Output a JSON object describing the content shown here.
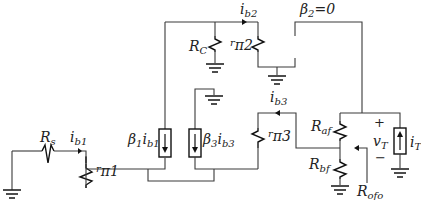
{
  "diagram": {
    "type": "small-signal equivalent circuit",
    "labels": {
      "Rs": {
        "main": "R",
        "sub": "s"
      },
      "ib1": {
        "main": "i",
        "sub": "b1"
      },
      "rpi1": {
        "main": "r",
        "sub": "π1"
      },
      "beta1_ib1": {
        "main": "β",
        "sub": "1",
        "main2": "i",
        "sub2": "b1"
      },
      "RC": {
        "main": "R",
        "sub": "C"
      },
      "ib2": {
        "main": "i",
        "sub": "b2"
      },
      "rpi2": {
        "main": "r",
        "sub": "π2"
      },
      "beta2": {
        "main": "β",
        "sub": "2",
        "rest": "=0"
      },
      "beta3_ib3": {
        "main": "β",
        "sub": "3",
        "main2": "i",
        "sub2": "b3"
      },
      "ib3": {
        "main": "i",
        "sub": "b3"
      },
      "rpi3": {
        "main": "r",
        "sub": "π3"
      },
      "Raf": {
        "main": "R",
        "sub": "af"
      },
      "Rbf": {
        "main": "R",
        "sub": "bf"
      },
      "vT": {
        "main": "v",
        "sub": "T",
        "plus": "+",
        "minus": "−"
      },
      "iT": {
        "main": "i",
        "sub": "T"
      },
      "Rofo": {
        "main": "R",
        "sub": "ofo"
      }
    },
    "components": [
      {
        "id": "Rs",
        "kind": "resistor"
      },
      {
        "id": "rpi1",
        "kind": "resistor"
      },
      {
        "id": "beta1_ib1",
        "kind": "dependent-current-source",
        "direction": "down"
      },
      {
        "id": "RC",
        "kind": "resistor"
      },
      {
        "id": "rpi2",
        "kind": "resistor"
      },
      {
        "id": "beta3_ib3",
        "kind": "dependent-current-source",
        "direction": "down"
      },
      {
        "id": "rpi3",
        "kind": "resistor"
      },
      {
        "id": "Raf",
        "kind": "resistor"
      },
      {
        "id": "Rbf",
        "kind": "resistor"
      },
      {
        "id": "iT",
        "kind": "current-source",
        "direction": "up"
      }
    ]
  }
}
